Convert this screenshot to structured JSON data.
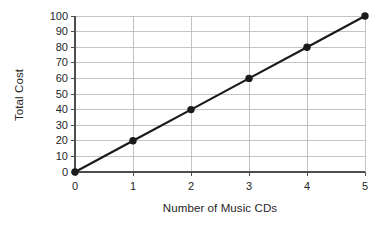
{
  "chart_data": {
    "type": "line",
    "title": "",
    "xlabel": "Number of Music CDs",
    "ylabel": "Total Cost",
    "x": [
      0,
      1,
      2,
      3,
      4,
      5
    ],
    "values": [
      0,
      20,
      40,
      60,
      80,
      100
    ],
    "series": [
      {
        "name": "Total Cost",
        "values": [
          0,
          20,
          40,
          60,
          80,
          100
        ]
      }
    ],
    "points": [
      {
        "x": 0,
        "y": 0
      },
      {
        "x": 1,
        "y": 20
      },
      {
        "x": 2,
        "y": 40
      },
      {
        "x": 3,
        "y": 60
      },
      {
        "x": 4,
        "y": 80
      },
      {
        "x": 5,
        "y": 100
      }
    ],
    "xlim": [
      0,
      5
    ],
    "ylim": [
      0,
      100
    ],
    "xticks": [
      "0",
      "1",
      "2",
      "3",
      "4",
      "5"
    ],
    "yticks": [
      "0",
      "10",
      "20",
      "30",
      "40",
      "50",
      "60",
      "70",
      "80",
      "90",
      "100"
    ],
    "grid": true,
    "grid_axis": "both",
    "legend": false,
    "legend_position": "none",
    "marker": "circle",
    "colors": {
      "line": "#1a1a1a",
      "marker": "#1a1a1a",
      "grid": "#b4b4b4",
      "axis": "#4d4d4d",
      "background": "#ffffff",
      "text": "#262626"
    },
    "annotations": []
  }
}
